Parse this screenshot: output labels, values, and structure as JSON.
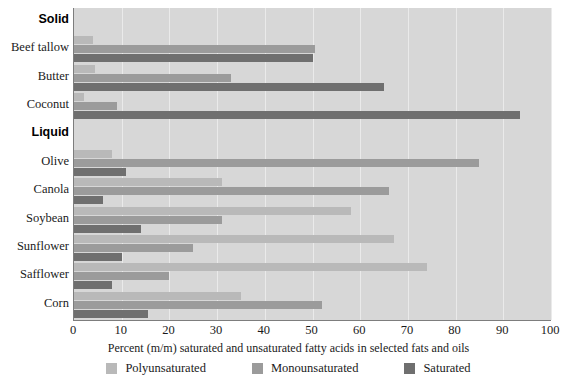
{
  "chart_data": {
    "type": "bar",
    "orientation": "horizontal",
    "title": "",
    "xlabel": "Percent (m/m) saturated and unsaturated fatty acids in selected fats and oils",
    "ylabel": "",
    "xlim": [
      0,
      100
    ],
    "xticks": [
      0,
      10,
      20,
      30,
      40,
      50,
      60,
      70,
      80,
      90,
      100
    ],
    "grid": true,
    "legend_position": "bottom",
    "categories": [
      "Beef tallow",
      "Butter",
      "Coconut",
      "Olive",
      "Canola",
      "Soybean",
      "Sunflower",
      "Safflower",
      "Corn"
    ],
    "groups": [
      {
        "label": "Solid",
        "categories": [
          "Beef tallow",
          "Butter",
          "Coconut"
        ]
      },
      {
        "label": "Liquid",
        "categories": [
          "Olive",
          "Canola",
          "Soybean",
          "Sunflower",
          "Safflower",
          "Corn"
        ]
      }
    ],
    "series": [
      {
        "name": "Polyunsaturated",
        "color": "#b9b9b9",
        "values": [
          4,
          4.5,
          2,
          8,
          31,
          58,
          67,
          74,
          35
        ]
      },
      {
        "name": "Monounsaturated",
        "color": "#9b9b9b",
        "values": [
          50.5,
          33,
          9,
          85,
          66,
          31,
          25,
          20,
          52
        ]
      },
      {
        "name": "Saturated",
        "color": "#6f6f6f",
        "values": [
          50,
          65,
          93.5,
          11,
          6,
          14,
          10,
          8,
          15.5
        ]
      }
    ]
  },
  "legend": {
    "items": [
      {
        "label": "Polyunsaturated",
        "color": "#b9b9b9"
      },
      {
        "label": "Monounsaturated",
        "color": "#9b9b9b"
      },
      {
        "label": "Saturated",
        "color": "#6f6f6f"
      }
    ]
  },
  "axis": {
    "x_title": "Percent (m/m) saturated and unsaturated fatty acids in selected fats and oils",
    "x_ticks": [
      "0",
      "10",
      "20",
      "30",
      "40",
      "50",
      "60",
      "70",
      "80",
      "90",
      "100"
    ]
  },
  "y_rows": [
    {
      "kind": "group",
      "label": "Solid"
    },
    {
      "kind": "category",
      "label": "Beef tallow"
    },
    {
      "kind": "category",
      "label": "Butter"
    },
    {
      "kind": "category",
      "label": "Coconut"
    },
    {
      "kind": "group",
      "label": "Liquid"
    },
    {
      "kind": "category",
      "label": "Olive"
    },
    {
      "kind": "category",
      "label": "Canola"
    },
    {
      "kind": "category",
      "label": "Soybean"
    },
    {
      "kind": "category",
      "label": "Sunflower"
    },
    {
      "kind": "category",
      "label": "Safflower"
    },
    {
      "kind": "category",
      "label": "Corn"
    }
  ],
  "colors": {
    "plot_background": "#d7d7d7",
    "gridline": "#eaeaea",
    "axis_line": "#7d7d7d",
    "page_background": "#ffffff"
  }
}
